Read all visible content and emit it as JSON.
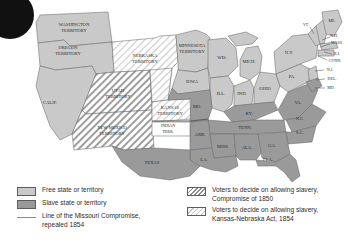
{
  "map": {
    "title": "United States slave and free states and territories, 1854",
    "colors": {
      "free": "#c9c9c9",
      "slave": "#9a9a9a",
      "hatch_1850": "#8d8d8d",
      "hatch_1854": "#c4c4c4",
      "border": "#6b6b6b",
      "ocean": "#ffffff",
      "compromise_line": "#6f6f6f",
      "label_text": "#2b2b2b"
    },
    "territories": [
      {
        "id": "washington-territory",
        "label": "WASHINGTON\nTERRITORY",
        "status": "free"
      },
      {
        "id": "oregon-territory",
        "label": "OREGON\nTERRITORY",
        "status": "free"
      },
      {
        "id": "utah-territory",
        "label": "UTAH\nTERRITORY",
        "status": "compromise-1850"
      },
      {
        "id": "new-mexico-territory",
        "label": "NEW MEXICO\nTERRITORY",
        "status": "compromise-1850"
      },
      {
        "id": "nebraska-territory",
        "label": "NEBRASKA\nTERRITORY",
        "status": "kansas-nebraska-1854"
      },
      {
        "id": "kansas-territory",
        "label": "KANSAS\nTERRITORY",
        "status": "kansas-nebraska-1854"
      },
      {
        "id": "minnesota-territory",
        "label": "MINNESOTA\nTERRITORY",
        "status": "free"
      },
      {
        "id": "indian-territory",
        "label": "INDIAN\nTERR.",
        "status": "unorganized"
      }
    ],
    "states": [
      {
        "id": "calif",
        "label": "CALIF.",
        "status": "free"
      },
      {
        "id": "iowa",
        "label": "IOWA",
        "status": "free"
      },
      {
        "id": "wis",
        "label": "WIS.",
        "status": "free"
      },
      {
        "id": "mich",
        "label": "MICH.",
        "status": "free"
      },
      {
        "id": "ill",
        "label": "ILL.",
        "status": "free"
      },
      {
        "id": "ind",
        "label": "IND.",
        "status": "free"
      },
      {
        "id": "ohio",
        "label": "OHIO",
        "status": "free"
      },
      {
        "id": "pa",
        "label": "PA.",
        "status": "free"
      },
      {
        "id": "ny",
        "label": "N.Y.",
        "status": "free"
      },
      {
        "id": "vt",
        "label": "VT.",
        "status": "free"
      },
      {
        "id": "me",
        "label": "ME.",
        "status": "free"
      },
      {
        "id": "nh",
        "label": "N.H.",
        "status": "free"
      },
      {
        "id": "mass",
        "label": "MASS.",
        "status": "free"
      },
      {
        "id": "ri",
        "label": "R.I.",
        "status": "free"
      },
      {
        "id": "conn",
        "label": "CONN.",
        "status": "free"
      },
      {
        "id": "nj",
        "label": "N.J.",
        "status": "free"
      },
      {
        "id": "del",
        "label": "DEL.",
        "status": "slave"
      },
      {
        "id": "md",
        "label": "MD.",
        "status": "slave"
      },
      {
        "id": "va",
        "label": "VA.",
        "status": "slave"
      },
      {
        "id": "ky",
        "label": "KY.",
        "status": "slave"
      },
      {
        "id": "mo",
        "label": "MO.",
        "status": "slave"
      },
      {
        "id": "ark",
        "label": "ARK.",
        "status": "slave"
      },
      {
        "id": "tenn",
        "label": "TENN.",
        "status": "slave"
      },
      {
        "id": "nc",
        "label": "N.C.",
        "status": "slave"
      },
      {
        "id": "sc",
        "label": "S.C.",
        "status": "slave"
      },
      {
        "id": "ga",
        "label": "GA.",
        "status": "slave"
      },
      {
        "id": "ala",
        "label": "ALA.",
        "status": "slave"
      },
      {
        "id": "miss",
        "label": "MISS.",
        "status": "slave"
      },
      {
        "id": "la",
        "label": "LA.",
        "status": "slave"
      },
      {
        "id": "texas",
        "label": "TEXAS",
        "status": "slave"
      },
      {
        "id": "fla",
        "label": "FLA.",
        "status": "slave"
      }
    ]
  },
  "legend": {
    "left": [
      {
        "swatch": "free-swatch",
        "text": "Free state or territory"
      },
      {
        "swatch": "slave-swatch",
        "text": "Slave state or territory"
      },
      {
        "swatch": "line-swatch",
        "text": "Line of the Missouri Compromise,\nrepealed 1854"
      }
    ],
    "right": [
      {
        "swatch": "hatch-heavy-swatch",
        "text": "Voters to decide on allowing slavery,\nCompromise of 1850"
      },
      {
        "swatch": "hatch-light-swatch",
        "text": "Voters to decide on allowing slavery,\nKansas-Nebraska Act, 1854"
      }
    ]
  }
}
